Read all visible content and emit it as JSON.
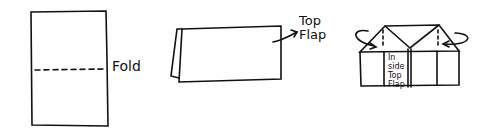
{
  "figures": [
    {
      "id": "step1",
      "description": "Unfolded rectangle with dashed fold line",
      "label": "Fold"
    },
    {
      "id": "step2",
      "description": "Folded card with arrow pointing to top flap",
      "label_lines": [
        "Top",
        "Flap"
      ]
    },
    {
      "id": "step3",
      "description": "Card with corners folded down into triangles, arrows showing folding",
      "label_lines": [
        "In",
        "side",
        "Top",
        "Flap"
      ]
    }
  ],
  "colors": {
    "stroke": "#111111",
    "background": "#ffffff"
  }
}
